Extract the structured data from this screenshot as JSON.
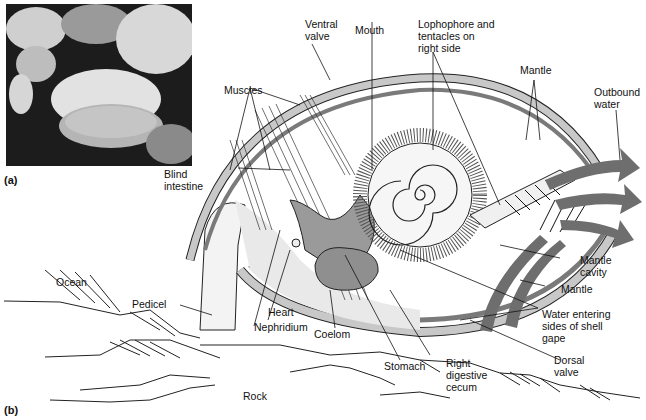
{
  "figure": {
    "panel_a": {
      "label": "(a)",
      "content": "photograph of brachiopods"
    },
    "panel_b": {
      "label": "(b)",
      "content": "cutaway diagram of brachiopod anatomy"
    },
    "labels": {
      "ventral_valve": "Ventral\nvalve",
      "mouth": "Mouth",
      "lophophore": "Lophophore and\ntentacles on\nright side",
      "mantle_top": "Mantle",
      "outbound_water": "Outbound\nwater",
      "muscles": "Muscles",
      "blind_intestine": "Blind\nintestine",
      "mantle_cavity": "Mantle\ncavity",
      "mantle_lower": "Mantle",
      "water_entering": "Water entering\nsides of shell\ngape",
      "dorsal_valve": "Dorsal\nvalve",
      "ocean": "Ocean",
      "pedicel": "Pedicel",
      "heart": "Heart",
      "nephridium": "Nephridium",
      "coelom": "Coelom",
      "stomach": "Stomach",
      "right_digestive_cecum": "Right\ndigestive\ncecum",
      "rock": "Rock"
    },
    "colors": {
      "shell": "#c8c8c8",
      "mantle": "#7a7a7a",
      "gut": "#9a9a9a",
      "arrow": "#6e6e6e",
      "line": "#111111"
    }
  }
}
